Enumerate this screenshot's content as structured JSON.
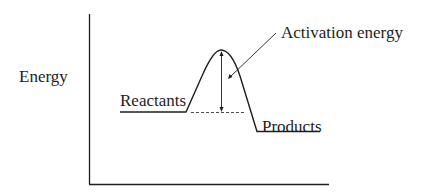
{
  "diagram": {
    "type": "reaction-energy-profile",
    "y_axis_label": "Energy",
    "labels": {
      "reactants": "Reactants",
      "products": "Products",
      "activation_energy": "Activation energy"
    },
    "colors": {
      "line": "#1e1e1e",
      "background": "#ffffff"
    },
    "levels": {
      "reactants_energy": "high",
      "transition_state": "peak",
      "products_energy": "lower than reactants"
    },
    "reaction": "exothermic"
  }
}
